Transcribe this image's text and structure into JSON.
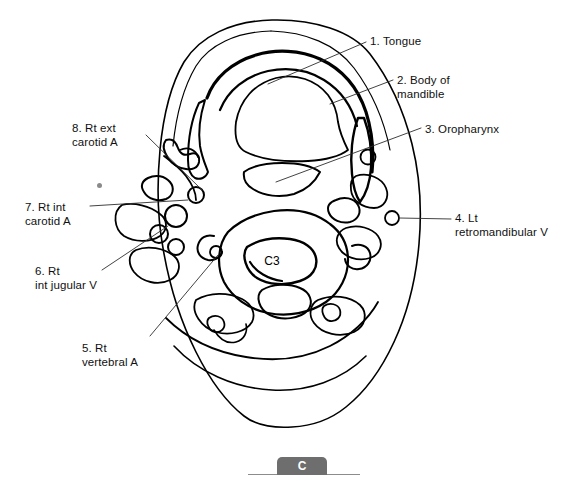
{
  "figure": {
    "panel_letter": "C",
    "vertebra_label": "C3",
    "modality": "axial-neck-line-drawing"
  },
  "labels": [
    {
      "id": "1",
      "text": "1. Tongue",
      "x": 370,
      "y": 34,
      "side": "right"
    },
    {
      "id": "2",
      "text": "2. Body of\nmandible",
      "x": 397,
      "y": 73,
      "side": "right"
    },
    {
      "id": "3",
      "text": "3. Oropharynx",
      "x": 425,
      "y": 122,
      "side": "right"
    },
    {
      "id": "4",
      "text": "4. Lt\nretromandibular V",
      "x": 455,
      "y": 211,
      "side": "right"
    },
    {
      "id": "5",
      "text": "5. Rt\nvertebral A",
      "x": 82,
      "y": 341,
      "side": "left"
    },
    {
      "id": "6",
      "text": "6. Rt\nint jugular V",
      "x": 35,
      "y": 264,
      "side": "left"
    },
    {
      "id": "7",
      "text": "7. Rt int\ncarotid A",
      "x": 25,
      "y": 200,
      "side": "left"
    },
    {
      "id": "8",
      "text": "8. Rt ext\ncarotid A",
      "x": 72,
      "y": 121,
      "side": "left"
    }
  ],
  "colors": {
    "ink": "#000000",
    "leader": "#3a3a3a",
    "tab_gray": "#6e6e6e",
    "rule_gray": "#8c8c8c",
    "background": "#ffffff"
  }
}
